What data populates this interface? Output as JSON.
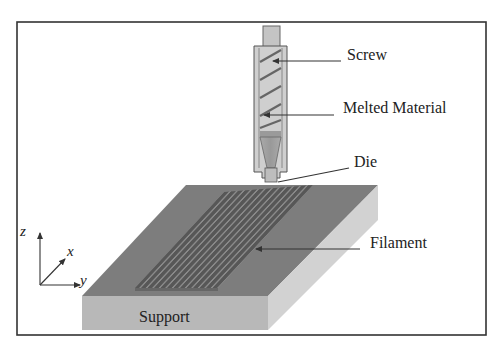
{
  "diagram": {
    "labels": {
      "screw": "Screw",
      "melted_material": "Melted Material",
      "die": "Die",
      "filament": "Filament",
      "support": "Support"
    },
    "axes": {
      "z": "z",
      "x": "x",
      "y": "y"
    },
    "colors": {
      "frame": "#333333",
      "support_top": "#7d7d7d",
      "support_front": "#b5b5b5",
      "support_side": "#cfcfcf",
      "filament": "#555555",
      "filament_gap": "#8a8a8a",
      "nozzle_body": "#c8c8c8",
      "nozzle_outline": "#555555",
      "leader_line": "#333333"
    }
  }
}
